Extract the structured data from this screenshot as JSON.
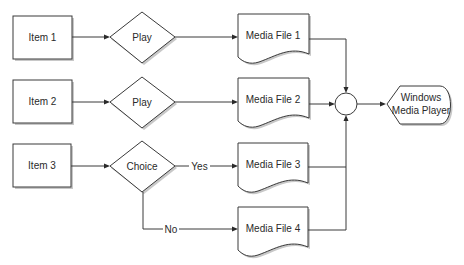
{
  "diagram": {
    "type": "flowchart",
    "nodes": {
      "item1": {
        "label": "Item 1",
        "shape": "rectangle"
      },
      "item2": {
        "label": "Item 2",
        "shape": "rectangle"
      },
      "item3": {
        "label": "Item 3",
        "shape": "rectangle"
      },
      "play1": {
        "label": "Play",
        "shape": "diamond"
      },
      "play2": {
        "label": "Play",
        "shape": "diamond"
      },
      "choice": {
        "label": "Choice",
        "shape": "diamond"
      },
      "media1": {
        "label": "Media File 1",
        "shape": "document"
      },
      "media2": {
        "label": "Media File 2",
        "shape": "document"
      },
      "media3": {
        "label": "Media File 3",
        "shape": "document"
      },
      "media4": {
        "label": "Media File 4",
        "shape": "document"
      },
      "junction": {
        "label": "",
        "shape": "circle"
      },
      "wmp": {
        "label_line1": "Windows",
        "label_line2": "Media Player",
        "shape": "display"
      }
    },
    "edges": [
      {
        "from": "item1",
        "to": "play1",
        "label": ""
      },
      {
        "from": "play1",
        "to": "media1",
        "label": ""
      },
      {
        "from": "item2",
        "to": "play2",
        "label": ""
      },
      {
        "from": "play2",
        "to": "media2",
        "label": ""
      },
      {
        "from": "item3",
        "to": "choice",
        "label": ""
      },
      {
        "from": "choice",
        "to": "media3",
        "label": "Yes"
      },
      {
        "from": "choice",
        "to": "media4",
        "label": "No"
      },
      {
        "from": "media1",
        "to": "junction",
        "label": ""
      },
      {
        "from": "media2",
        "to": "junction",
        "label": ""
      },
      {
        "from": "media3",
        "to": "junction",
        "label": ""
      },
      {
        "from": "media4",
        "to": "junction",
        "label": ""
      },
      {
        "from": "junction",
        "to": "wmp",
        "label": ""
      }
    ],
    "edge_labels": {
      "yes": "Yes",
      "no": "No"
    },
    "colors": {
      "stroke": "#3a3a3a",
      "fill": "#ffffff",
      "shadow": "#c8c8c8",
      "text": "#2a2a2a"
    }
  }
}
